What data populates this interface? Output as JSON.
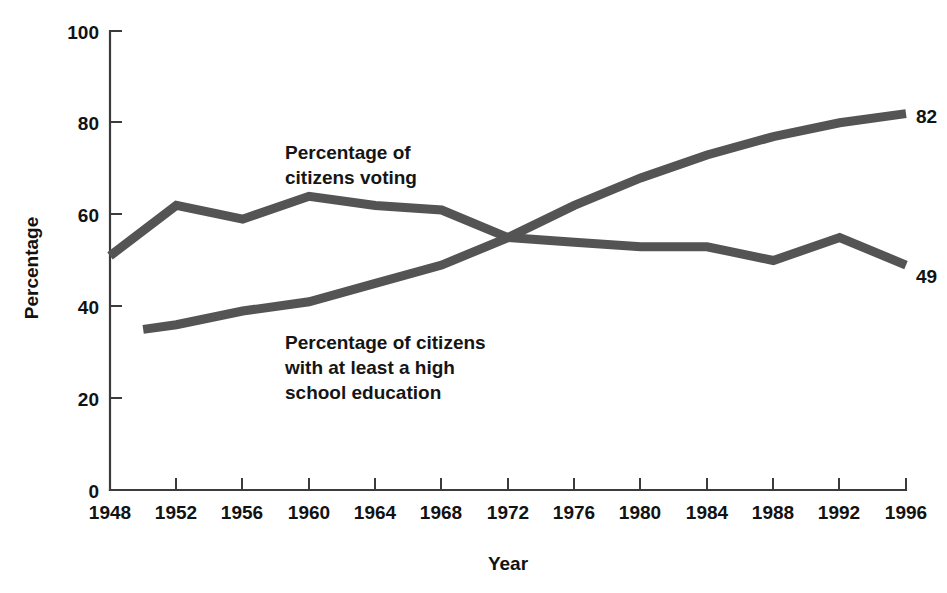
{
  "chart_data": {
    "type": "line",
    "title": "",
    "xlabel": "Year",
    "ylabel": "Percentage",
    "xlim": [
      1948,
      1996
    ],
    "ylim": [
      0,
      100
    ],
    "grid": false,
    "legend_position": "inline-annotations",
    "x_ticks": [
      1948,
      1952,
      1956,
      1960,
      1964,
      1968,
      1972,
      1976,
      1980,
      1984,
      1988,
      1992,
      1996
    ],
    "y_ticks": [
      0,
      20,
      40,
      60,
      80,
      100
    ],
    "series": [
      {
        "name": "Percentage of citizens voting",
        "annotation": [
          "Percentage of",
          "citizens voting"
        ],
        "end_value_label": "49",
        "x": [
          1948,
          1952,
          1956,
          1960,
          1964,
          1968,
          1972,
          1976,
          1980,
          1984,
          1988,
          1992,
          1996
        ],
        "values": [
          51,
          62,
          59,
          64,
          62,
          61,
          55,
          54,
          53,
          53,
          50,
          55,
          49
        ]
      },
      {
        "name": "Percentage of citizens with at least a high school education",
        "annotation": [
          "Percentage of citizens",
          "with at least a high",
          "school education"
        ],
        "end_value_label": "82",
        "x": [
          1950,
          1952,
          1956,
          1960,
          1964,
          1968,
          1972,
          1976,
          1980,
          1984,
          1988,
          1992,
          1996
        ],
        "values": [
          35,
          36,
          39,
          41,
          45,
          49,
          55,
          62,
          68,
          73,
          77,
          80,
          82
        ]
      }
    ]
  },
  "axes": {
    "y_title": "Percentage",
    "x_title": "Year",
    "y_tick_labels": [
      "0",
      "20",
      "40",
      "60",
      "80",
      "100"
    ],
    "x_tick_labels": [
      "1948",
      "1952",
      "1956",
      "1960",
      "1964",
      "1968",
      "1972",
      "1976",
      "1980",
      "1984",
      "1988",
      "1992",
      "1996"
    ]
  },
  "annotations": {
    "voting_line1": "Percentage of",
    "voting_line2": "citizens voting",
    "education_line1": "Percentage of citizens",
    "education_line2": "with at least a high",
    "education_line3": "school education",
    "voting_end_value": "49",
    "education_end_value": "82"
  },
  "colors": {
    "background": "#ffffff",
    "line": "#545454",
    "axis": "#3b3b3b",
    "text": "#121212"
  }
}
